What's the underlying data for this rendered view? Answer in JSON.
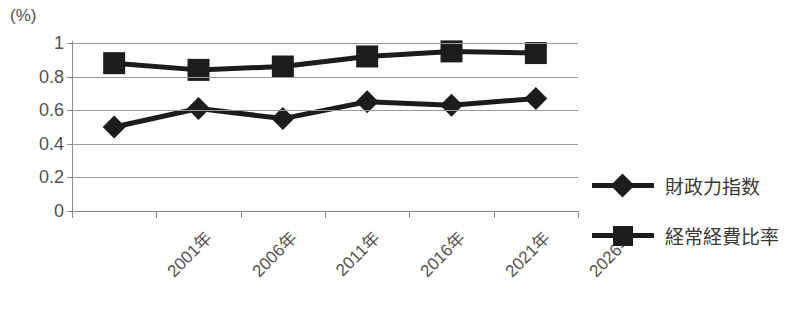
{
  "chart_data": {
    "type": "line",
    "title": "",
    "xlabel": "",
    "ylabel": "(%)",
    "unit_label": "(%)",
    "categories": [
      "2001年",
      "2006年",
      "2011年",
      "2016年",
      "2021年",
      "2026年"
    ],
    "series": [
      {
        "name": "財政力指数",
        "marker": "diamond",
        "color": "#1c1c1c",
        "values": [
          0.5,
          0.61,
          0.55,
          0.65,
          0.63,
          0.67
        ]
      },
      {
        "name": "経常経費比率",
        "marker": "square",
        "color": "#1c1c1c",
        "values": [
          0.88,
          0.84,
          0.86,
          0.92,
          0.95,
          0.94
        ]
      }
    ],
    "ylim": [
      0,
      1
    ],
    "ytick_labels": [
      "1",
      "0.8",
      "0.6",
      "0.4",
      "0.2",
      "0"
    ],
    "ytick_values": [
      1,
      0.8,
      0.6,
      0.4,
      0.2,
      0
    ],
    "grid": true,
    "legend_position": "right"
  },
  "legend": {
    "items": [
      {
        "label": "財政力指数",
        "marker": "diamond"
      },
      {
        "label": "経常経費比率",
        "marker": "square"
      }
    ]
  },
  "title_strip": ""
}
